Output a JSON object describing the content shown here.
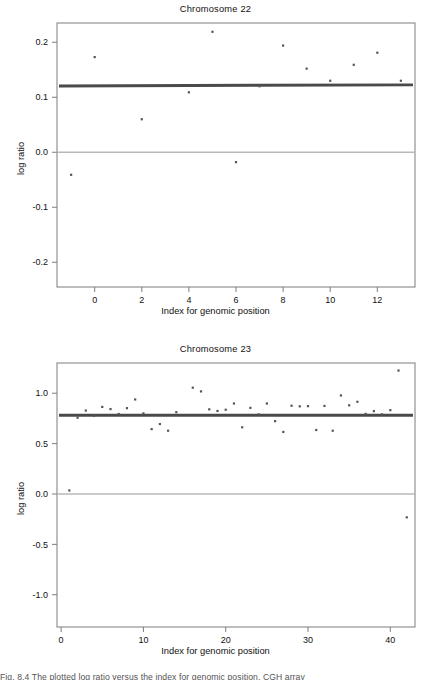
{
  "figure": {
    "caption_partial": "Fig. 8.4  The plotted log ratio versus the index for genomic position, CGH array"
  },
  "panels": [
    {
      "id": "chromosome-22",
      "title": "Chromosome 22",
      "xlabel": "Index for genomic position",
      "ylabel": "log ratio",
      "xticks": [
        "0",
        "2",
        "4",
        "6",
        "8",
        "10",
        "12"
      ],
      "yticks": [
        "0.2",
        "0.1",
        "0.0",
        "-0.1",
        "-0.2"
      ]
    },
    {
      "id": "chromosome-23",
      "title": "Chromosome 23",
      "xlabel": "Index for genomic position",
      "ylabel": "log ratio",
      "xticks": [
        "0",
        "10",
        "20",
        "30",
        "40"
      ],
      "yticks": [
        "1.0",
        "0.5",
        "0.0",
        "-0.5",
        "-1.0"
      ]
    }
  ],
  "chart_data": [
    {
      "type": "scatter",
      "title": "Chromosome 22",
      "xlabel": "Index for genomic position",
      "ylabel": "log ratio",
      "xlim": [
        -1.6,
        13.6
      ],
      "ylim": [
        -0.245,
        0.235
      ],
      "xticks": [
        0,
        2,
        4,
        6,
        8,
        10,
        12
      ],
      "yticks": [
        -0.2,
        -0.1,
        0.0,
        0.1,
        0.2
      ],
      "grid": false,
      "legend": "none",
      "reference_line": {
        "y": 0.0,
        "color": "#b9b9b9",
        "label": "zero line"
      },
      "fit_line": {
        "y_start": 0.1205,
        "y_end": 0.1225,
        "color": "#4a4a4a",
        "label": "segment mean 0.121"
      },
      "x": [
        -1,
        0,
        1,
        2,
        3,
        4,
        5,
        6,
        7,
        8,
        9,
        10,
        11,
        12,
        13
      ],
      "y": [
        -0.041,
        0.173,
        null,
        0.06,
        null,
        0.109,
        0.219,
        -0.018,
        0.12,
        0.194,
        0.152,
        0.13,
        0.159,
        0.181,
        0.13
      ],
      "points": [
        {
          "x": -1,
          "y": -0.041
        },
        {
          "x": 0,
          "y": 0.173
        },
        {
          "x": 2,
          "y": 0.06
        },
        {
          "x": 4,
          "y": 0.109
        },
        {
          "x": 5,
          "y": 0.219
        },
        {
          "x": 6,
          "y": -0.018
        },
        {
          "x": 7,
          "y": 0.12
        },
        {
          "x": 8,
          "y": 0.194
        },
        {
          "x": 9,
          "y": 0.152
        },
        {
          "x": 10,
          "y": 0.13
        },
        {
          "x": 11,
          "y": 0.159
        },
        {
          "x": 12,
          "y": 0.181
        },
        {
          "x": 13,
          "y": 0.13
        }
      ]
    },
    {
      "type": "scatter",
      "title": "Chromosome 23",
      "xlabel": "Index for genomic position",
      "ylabel": "log ratio",
      "xlim": [
        -0.5,
        43.0
      ],
      "ylim": [
        -1.32,
        1.3
      ],
      "xticks": [
        0,
        10,
        20,
        30,
        40
      ],
      "yticks": [
        -1.0,
        -0.5,
        0.0,
        0.5,
        1.0
      ],
      "grid": false,
      "legend": "none",
      "reference_line": {
        "y": 0.0,
        "color": "#b9b9b9",
        "label": "zero line"
      },
      "fit_line": {
        "y_start": 0.782,
        "y_end": 0.782,
        "color": "#4a4a4a",
        "label": "segment mean 0.78"
      },
      "points": [
        {
          "x": 1,
          "y": 0.035
        },
        {
          "x": 2,
          "y": 0.757
        },
        {
          "x": 3,
          "y": 0.828
        },
        {
          "x": 4,
          "y": 0.776
        },
        {
          "x": 5,
          "y": 0.864
        },
        {
          "x": 6,
          "y": 0.843
        },
        {
          "x": 7,
          "y": 0.794
        },
        {
          "x": 8,
          "y": 0.852
        },
        {
          "x": 9,
          "y": 0.938
        },
        {
          "x": 10,
          "y": 0.8
        },
        {
          "x": 11,
          "y": 0.644
        },
        {
          "x": 12,
          "y": 0.694
        },
        {
          "x": 13,
          "y": 0.628
        },
        {
          "x": 14,
          "y": 0.812
        },
        {
          "x": 16,
          "y": 1.055
        },
        {
          "x": 17,
          "y": 1.018
        },
        {
          "x": 18,
          "y": 0.84
        },
        {
          "x": 19,
          "y": 0.824
        },
        {
          "x": 20,
          "y": 0.836
        },
        {
          "x": 21,
          "y": 0.898
        },
        {
          "x": 22,
          "y": 0.662
        },
        {
          "x": 23,
          "y": 0.855
        },
        {
          "x": 24,
          "y": 0.79
        },
        {
          "x": 25,
          "y": 0.898
        },
        {
          "x": 26,
          "y": 0.723
        },
        {
          "x": 27,
          "y": 0.616
        },
        {
          "x": 28,
          "y": 0.876
        },
        {
          "x": 29,
          "y": 0.87
        },
        {
          "x": 30,
          "y": 0.872
        },
        {
          "x": 31,
          "y": 0.635
        },
        {
          "x": 32,
          "y": 0.874
        },
        {
          "x": 33,
          "y": 0.628
        },
        {
          "x": 34,
          "y": 0.978
        },
        {
          "x": 35,
          "y": 0.88
        },
        {
          "x": 36,
          "y": 0.915
        },
        {
          "x": 37,
          "y": 0.795
        },
        {
          "x": 38,
          "y": 0.822
        },
        {
          "x": 39,
          "y": 0.79
        },
        {
          "x": 40,
          "y": 0.832
        },
        {
          "x": 41,
          "y": 1.225
        },
        {
          "x": 42,
          "y": -0.232
        }
      ]
    }
  ]
}
